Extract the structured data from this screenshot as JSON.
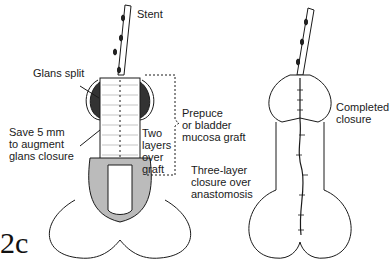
{
  "figure_label": "2c",
  "left_drawing": {
    "labels": {
      "stent": "Stent",
      "glans_split": "Glans split",
      "save_5mm": "Save 5 mm\nto augment\nglans closure",
      "two_layers": "Two\nlayers\nover\ngraft",
      "graft": "Prepuce\nor bladder\nmucosa graft",
      "three_layer": "Three-layer\nclosure over\nanastomosis"
    }
  },
  "right_drawing": {
    "labels": {
      "completed": "Completed\nclosure"
    }
  },
  "colors": {
    "line": "#1a1a1a",
    "dark_fill": "#333333",
    "background": "#ffffff"
  }
}
